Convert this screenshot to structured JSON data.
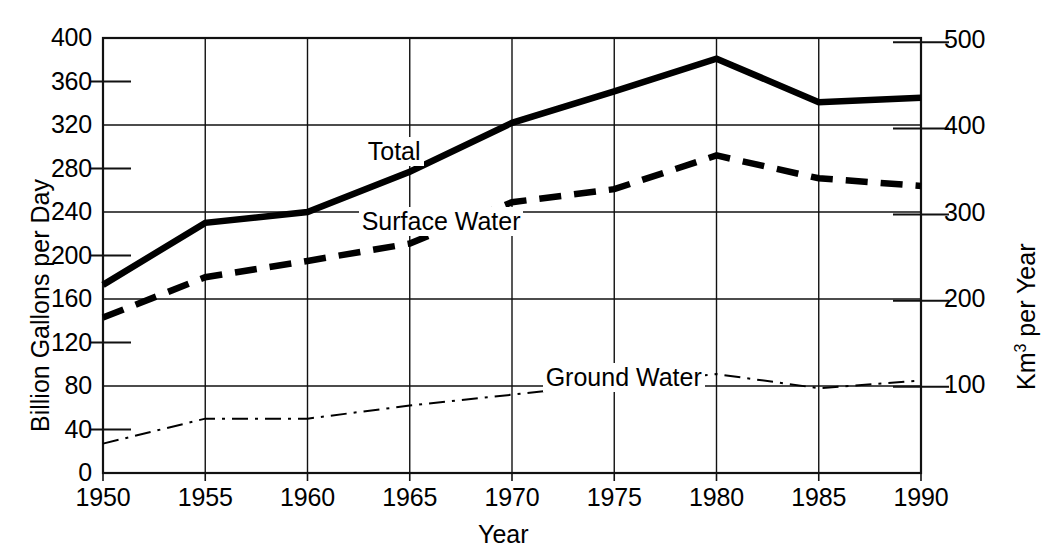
{
  "chart_data": {
    "type": "line",
    "title": "",
    "xlabel": "Year",
    "ylabel": "Billion Gallons per Day",
    "ylabel_right_pre": "Km",
    "ylabel_right_sup": "3",
    "ylabel_right_post": " per Year",
    "x": [
      1950,
      1955,
      1960,
      1965,
      1970,
      1975,
      1980,
      1985,
      1990
    ],
    "xlim": [
      1950,
      1990
    ],
    "ylim": [
      0,
      400
    ],
    "ylim_right": [
      0,
      505
    ],
    "grid": true,
    "legend_position": "inline-annotations",
    "xticks": [
      "1950",
      "1955",
      "1960",
      "1965",
      "1970",
      "1975",
      "1980",
      "1985",
      "1990"
    ],
    "yticks_left": [
      "0",
      "40",
      "80",
      "120",
      "160",
      "200",
      "240",
      "280",
      "320",
      "360",
      "400"
    ],
    "yticks_left_major": [
      "0",
      "80",
      "160",
      "240",
      "320",
      "400"
    ],
    "yticks_left_minor": [
      "40",
      "120",
      "200",
      "280",
      "360"
    ],
    "yticks_right": [
      "100",
      "200",
      "300",
      "400",
      "500"
    ],
    "series": [
      {
        "name": "Total",
        "style": "solid-thick",
        "values": [
          173,
          230,
          240,
          277,
          322,
          351,
          381,
          341,
          345
        ]
      },
      {
        "name": "Surface Water",
        "style": "dashed-thick",
        "values": [
          143,
          180,
          195,
          211,
          249,
          261,
          292,
          271,
          264
        ]
      },
      {
        "name": "Ground Water",
        "style": "dash-dot-thin",
        "values": [
          27,
          50,
          50,
          62,
          72,
          82,
          91,
          78,
          85
        ]
      }
    ],
    "annotations": [
      {
        "text": "Total",
        "x": 1962.8,
        "y": 295
      },
      {
        "text": "Surface Water",
        "x": 1962.5,
        "y": 231
      },
      {
        "text": "Ground Water",
        "x": 1971.5,
        "y": 87
      }
    ]
  }
}
